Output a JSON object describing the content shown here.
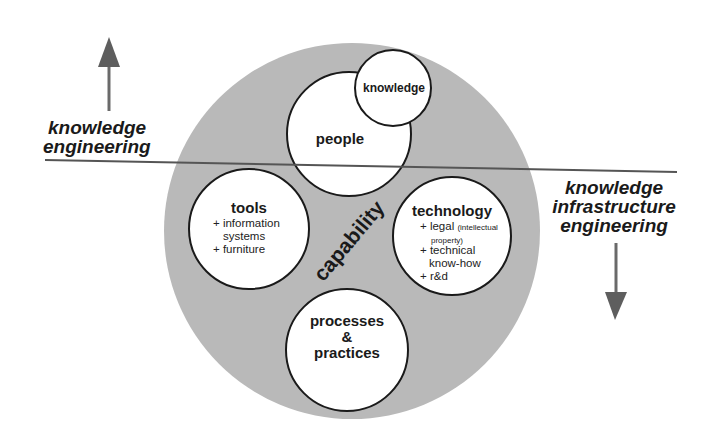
{
  "diagram": {
    "center_label": "capability",
    "colors": {
      "outer_ring": "#b9b9b9",
      "circle_fill": "#ffffff",
      "stroke": "#1a1a1a",
      "divider": "#555555",
      "arrow": "#5e5e5e"
    },
    "axis_top": {
      "line1": "knowledge",
      "line2": "engineering",
      "arrow": "up-arrow"
    },
    "axis_bottom": {
      "line1": "knowledge",
      "line2": "infrastructure",
      "line3": "engineering",
      "arrow": "down-arrow"
    },
    "nodes": {
      "people": {
        "title": "people"
      },
      "knowledge": {
        "title": "knowledge"
      },
      "tools": {
        "title": "tools",
        "items": [
          "+ information",
          "systems",
          "+ furniture"
        ]
      },
      "technology": {
        "title": "technology",
        "items": [
          "+ legal",
          "(intellectual",
          "property)",
          "+ technical",
          "know-how",
          "+ r&d"
        ]
      },
      "processes": {
        "line1": "processes",
        "line2": "&",
        "line3": "practices"
      }
    }
  }
}
